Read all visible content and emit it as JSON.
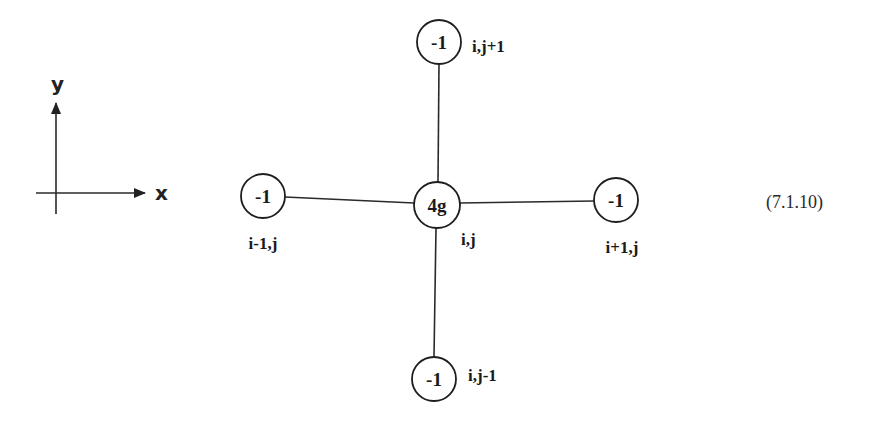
{
  "axes": {
    "x_label": "x",
    "y_label": "y"
  },
  "stencil": {
    "center": {
      "value": "4g",
      "label": "i,j"
    },
    "top": {
      "value": "-1",
      "label": "i,j+1"
    },
    "bottom": {
      "value": "-1",
      "label": "i,j-1"
    },
    "left": {
      "value": "-1",
      "label": "i-1,j"
    },
    "right": {
      "value": "-1",
      "label": "i+1,j"
    }
  },
  "equation_number": "(7.1.10)",
  "colors": {
    "ink": "#1e1e1e",
    "background": "#ffffff"
  }
}
